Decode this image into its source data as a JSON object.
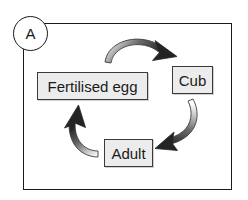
{
  "diagram": {
    "panel_label": "A",
    "background_color": "#ffffff",
    "border_color": "#1a1a1a",
    "node_fill_color": "#ececec",
    "node_border_color": "#3a3a3a",
    "arrow_dark_color": "#2b2b2b",
    "arrow_light_color": "#f2f2f2",
    "nodes": [
      {
        "id": "egg",
        "label": "Fertilised egg"
      },
      {
        "id": "cub",
        "label": "Cub"
      },
      {
        "id": "adult",
        "label": "Adult"
      }
    ],
    "arrows": [
      {
        "id": "egg-to-cub",
        "name": "arrow-egg-to-cub",
        "from": "Fertilised egg",
        "to": "Cub",
        "direction": "clockwise"
      },
      {
        "id": "cub-to-adult",
        "name": "arrow-cub-to-adult",
        "from": "Cub",
        "to": "Adult",
        "direction": "clockwise"
      },
      {
        "id": "adult-to-egg",
        "name": "arrow-adult-to-egg",
        "from": "Adult",
        "to": "Fertilised egg",
        "direction": "clockwise"
      }
    ]
  }
}
